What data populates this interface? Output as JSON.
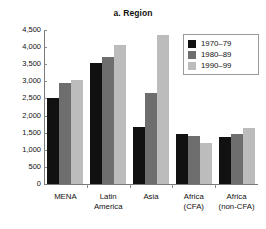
{
  "chart_data": {
    "type": "bar",
    "title": "a. Region",
    "xlabel": "",
    "ylabel": "",
    "ylim": [
      0,
      4500
    ],
    "yticks": [
      "0",
      "500",
      "1,000",
      "1,500",
      "2,000",
      "2,500",
      "3,000",
      "3,500",
      "4,000",
      "4,500"
    ],
    "ytick_values": [
      0,
      500,
      1000,
      1500,
      2000,
      2500,
      3000,
      3500,
      4000,
      4500
    ],
    "grid": false,
    "legend_position": "top-right",
    "categories": [
      "MENA",
      "Latin\nAmerica",
      "Asia",
      "Africa\n(CFA)",
      "Africa\n(non-CFA)"
    ],
    "series": [
      {
        "name": "1970–79",
        "color": "#111111",
        "values": [
          2520,
          3530,
          1680,
          1460,
          1360
        ]
      },
      {
        "name": "1980–89",
        "color": "#6e6e6e",
        "values": [
          2940,
          3720,
          2660,
          1390,
          1450
        ]
      },
      {
        "name": "1990–99",
        "color": "#bcbcbc",
        "values": [
          3050,
          4060,
          4340,
          1190,
          1650
        ]
      }
    ]
  }
}
